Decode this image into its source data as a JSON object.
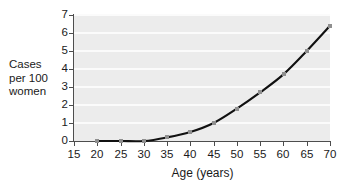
{
  "chart_data": {
    "type": "line",
    "title": "",
    "xlabel": "Age (years)",
    "ylabel": "Cases per 100 women",
    "ylabel_lines": [
      "Cases",
      "per 100",
      "women"
    ],
    "xlim": [
      15,
      70
    ],
    "ylim": [
      0,
      7
    ],
    "xticks": [
      15,
      20,
      25,
      30,
      35,
      40,
      45,
      50,
      55,
      60,
      65,
      70
    ],
    "xticklabels": [
      "15",
      "20",
      "25",
      "30",
      "35",
      "40",
      "45",
      "50",
      "55",
      "60",
      "65",
      "70"
    ],
    "yticks": [
      0,
      1,
      2,
      3,
      4,
      5,
      6,
      7
    ],
    "yticklabels": [
      "0",
      "1",
      "2",
      "3",
      "4",
      "5",
      "6",
      "7"
    ],
    "grid": "horizontal",
    "legend": "none",
    "series": [
      {
        "name": "Cases per 100 women",
        "x": [
          20,
          25,
          30,
          35,
          40,
          45,
          50,
          55,
          60,
          65,
          70
        ],
        "values": [
          0,
          0,
          0,
          0.2,
          0.5,
          1.0,
          1.8,
          2.7,
          3.7,
          5.0,
          6.4
        ],
        "line_color": "#111111",
        "marker_color": "#8f8f8f",
        "marker": "square"
      }
    ],
    "plot_background": "#ececec",
    "gridline_color": "#fbfbfb",
    "axis_color": "#4d4d4d",
    "page_background": "#ffffff"
  }
}
